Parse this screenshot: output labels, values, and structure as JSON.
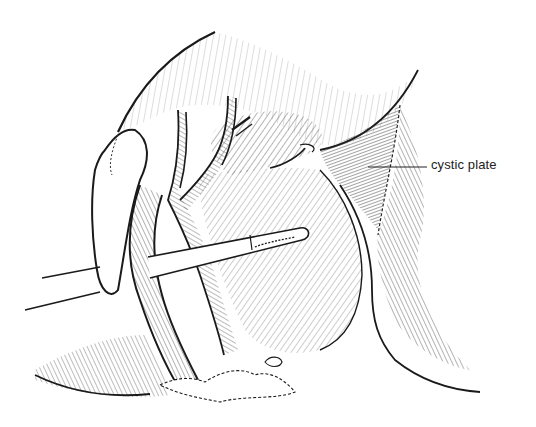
{
  "figure": {
    "type": "anatomical line illustration",
    "colors": {
      "ink": "#1a1a1a",
      "background": "#ffffff",
      "hatch": "#555555"
    }
  },
  "labels": [
    {
      "text": "cystic plate",
      "anchor_x": 368,
      "anchor_y": 167,
      "text_x": 431,
      "text_y": 167
    }
  ]
}
